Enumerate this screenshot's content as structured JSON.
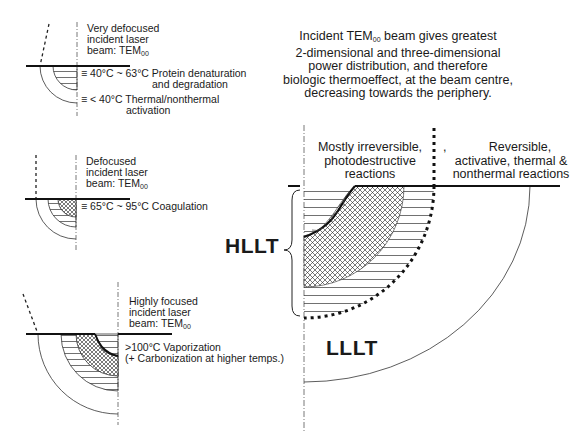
{
  "title": {
    "line1_pre": "Incident TEM",
    "line1_sub": "00",
    "line1_post": " beam gives greatest",
    "line2": "2-dimensional and three-dimensional",
    "line3": "power distribution, and therefore",
    "line4": "biologic thermoeffect, at the beam centre,",
    "line5": "decreasing towards the periphery."
  },
  "panels": [
    {
      "id": "very-defocused",
      "beam_line1": "Very defocused",
      "beam_line2": "incident laser",
      "beam_line3_pre": "beam: TEM",
      "beam_line3_sub": "00",
      "zones": [
        {
          "symbol": "≡",
          "text_line1": "40°C ~ 63°C Protein denaturation",
          "text_line2": "and degradation"
        },
        {
          "symbol": "≡",
          "text_line1": "< 40°C Thermal/nonthermal",
          "text_line2": "activation"
        }
      ]
    },
    {
      "id": "defocused",
      "beam_line1": "Defocused",
      "beam_line2": "incident laser",
      "beam_line3_pre": "beam: TEM",
      "beam_line3_sub": "00",
      "zones": [
        {
          "symbol": "≡",
          "text_line1": "65°C ~ 95°C Coagulation"
        }
      ]
    },
    {
      "id": "highly-focused",
      "beam_line1": "Highly focused",
      "beam_line2": "incident laser",
      "beam_line3_pre": "beam: TEM",
      "beam_line3_sub": "00",
      "zones": [
        {
          "text_line1": ">100°C Vaporization",
          "text_line2": "(+ Carbonization at higher temps.)"
        }
      ]
    }
  ],
  "main_diagram": {
    "left_region_line1": "Mostly irreversible,",
    "left_region_line2": "photodestructive",
    "left_region_line3": "reactions",
    "right_region_line1": "Reversible,",
    "right_region_line2": "activative, thermal &",
    "right_region_line3": "nonthermal reactions",
    "stray_mark": ",",
    "hllt_label": "HLLT",
    "lllt_label": "LLLT"
  },
  "colors": {
    "ink": "#1a1a1a",
    "background": "#ffffff"
  }
}
